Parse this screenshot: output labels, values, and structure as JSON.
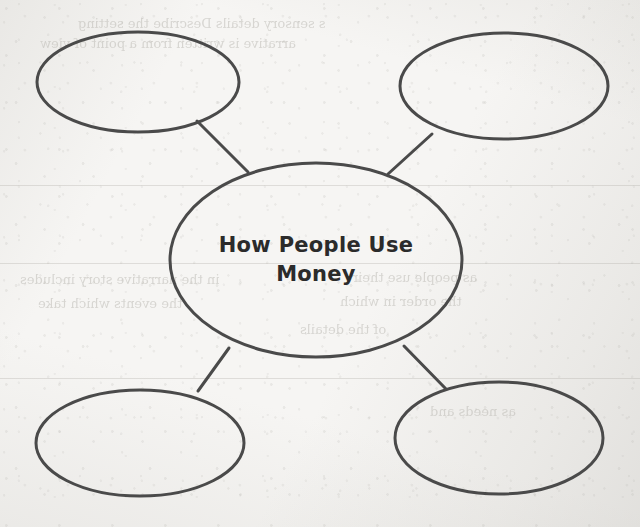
{
  "page": {
    "kind": "graphic-organizer-worksheet",
    "paper_color": "#f6f5f3",
    "ink_color": "#4a4a4a",
    "text_color": "#2b2b2b"
  },
  "diagram": {
    "type": "web-cluster-organizer",
    "center": {
      "label_line_1": "How People Use",
      "label_line_2": "Money",
      "cx": 316,
      "cy": 260,
      "rx": 146,
      "ry": 97
    },
    "satellites": [
      {
        "name": "top-left",
        "label": "",
        "cx": 138,
        "cy": 82,
        "rx": 101,
        "ry": 50
      },
      {
        "name": "top-right",
        "label": "",
        "cx": 504,
        "cy": 86,
        "rx": 104,
        "ry": 53
      },
      {
        "name": "bottom-left",
        "label": "",
        "cx": 140,
        "cy": 443,
        "rx": 104,
        "ry": 53
      },
      {
        "name": "bottom-right",
        "label": "",
        "cx": 499,
        "cy": 438,
        "rx": 104,
        "ry": 56
      }
    ],
    "connectors": [
      {
        "name": "center-to-top-left",
        "x1": 197,
        "y1": 121,
        "x2": 248,
        "y2": 172
      },
      {
        "name": "center-to-top-right",
        "x1": 432,
        "y1": 134,
        "x2": 388,
        "y2": 174
      },
      {
        "name": "center-to-bottom-left",
        "x1": 198,
        "y1": 391,
        "x2": 229,
        "y2": 348
      },
      {
        "name": "center-to-bottom-right",
        "x1": 446,
        "y1": 389,
        "x2": 404,
        "y2": 346
      }
    ]
  },
  "bleed_through": {
    "note": "Illegible mirrored show-through from the reverse side of the page.",
    "lines": [
      {
        "text": "s   sensory details  Describe the setting",
        "x": 78,
        "y": 16,
        "size": 13
      },
      {
        "text": "arrative  is   written  from  a point  of  view",
        "x": 40,
        "y": 36,
        "size": 13
      },
      {
        "text": "in the narrative  story  includes",
        "x": 20,
        "y": 272,
        "size": 13
      },
      {
        "text": "as people use their",
        "x": 352,
        "y": 270,
        "size": 13
      },
      {
        "text": "the events  which  take",
        "x": 38,
        "y": 296,
        "size": 13
      },
      {
        "text": "the  order  in which",
        "x": 340,
        "y": 294,
        "size": 13
      },
      {
        "text": "of  the  details",
        "x": 300,
        "y": 322,
        "size": 13
      },
      {
        "text": "as  needs  and",
        "x": 430,
        "y": 404,
        "size": 13
      }
    ]
  }
}
